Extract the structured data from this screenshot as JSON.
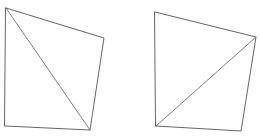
{
  "figure": {
    "background_color": "#ffffff",
    "stroke_color": "#555555",
    "diagonal_stroke_color": "#6a6a6a",
    "shape_count": 2,
    "canvas": {
      "width": 260,
      "height": 137
    }
  },
  "shapes": [
    {
      "id": "left-quadrilateral",
      "label": "Left quadrilateral",
      "outline_points": "6,8 104,38 90,130 5,126",
      "vertices": [
        {
          "name": "top-left",
          "x": 6,
          "y": 8
        },
        {
          "name": "top-right",
          "x": 104,
          "y": 38
        },
        {
          "name": "bottom-right",
          "x": 90,
          "y": 130
        },
        {
          "name": "bottom-left",
          "x": 5,
          "y": 126
        }
      ],
      "diagonal": {
        "from": "top-left",
        "to": "bottom-right",
        "x1": 6,
        "y1": 8,
        "x2": 90,
        "y2": 130,
        "direction": "top-left-to-bottom-right"
      }
    },
    {
      "id": "right-quadrilateral",
      "label": "Right quadrilateral",
      "outline_points": "155,12 256,37 241,131 156,126",
      "vertices": [
        {
          "name": "top-left",
          "x": 155,
          "y": 12
        },
        {
          "name": "top-right",
          "x": 256,
          "y": 37
        },
        {
          "name": "bottom-right",
          "x": 241,
          "y": 131
        },
        {
          "name": "bottom-left",
          "x": 156,
          "y": 126
        }
      ],
      "diagonal": {
        "from": "bottom-left",
        "to": "top-right",
        "x1": 156,
        "y1": 126,
        "x2": 256,
        "y2": 37,
        "direction": "bottom-left-to-top-right"
      }
    }
  ]
}
